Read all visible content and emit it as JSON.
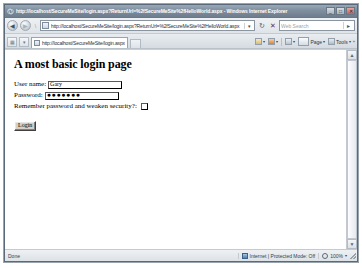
{
  "window": {
    "title": "http://localhost/SecureMeSite/login.aspx?ReturnUrl=%2fSecureMeSite%2fHelloWorld.aspx - Windows Internet Explorer",
    "icon": "ie-logo-icon",
    "minimize_label": "_",
    "maximize_label": "□",
    "close_label": "✕"
  },
  "navbar": {
    "back_label": "◀",
    "forward_label": "▶",
    "address_value": "http://localhost/SecureMeSite/login.aspx?ReturnUrl=%2fSecureMeSite%2fHelloWorld.aspx",
    "address_dropdown_label": "▾",
    "refresh_label": "↻",
    "stop_label": "✕",
    "search_placeholder": "Web Search",
    "search_go_label": "▸"
  },
  "tabbar": {
    "quick_tabs_label": "▦",
    "tab_list_label": "▾",
    "tabs": [
      {
        "title": "http://localhost/SecureMeSite/login.aspx"
      }
    ],
    "new_tab_label": "",
    "commands": [
      {
        "name": "home",
        "label": "",
        "caret": "▾"
      },
      {
        "name": "feeds",
        "label": "",
        "caret": "▾"
      },
      {
        "name": "print",
        "label": "",
        "caret": "▾"
      },
      {
        "name": "page",
        "label": "Page",
        "caret": "▾"
      },
      {
        "name": "tools",
        "label": "Tools",
        "caret": "▾"
      }
    ]
  },
  "page": {
    "heading": "A most basic login page",
    "fields": [
      {
        "name": "username",
        "label": "User name:",
        "value": "Gary"
      },
      {
        "name": "password",
        "label": "Password:",
        "value": "●●●●●●●"
      }
    ],
    "checkbox": {
      "label": "Remember password and weaken security?:",
      "checked": false
    },
    "submit_label": "Login"
  },
  "scrollbar": {
    "up_label": "▲",
    "down_label": "▼"
  },
  "statusbar": {
    "status_text": "Done",
    "zone_text": "Internet | Protected Mode: Off",
    "zoom_text": "100%",
    "zoom_caret": "▾"
  }
}
